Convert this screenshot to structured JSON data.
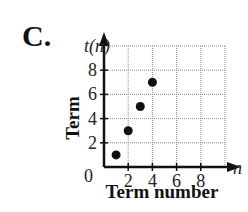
{
  "figure_label": "C.",
  "chart_data": {
    "type": "scatter",
    "title": "",
    "xlabel": "Term number",
    "ylabel": "Term",
    "x_axis_var": "n",
    "y_axis_var": "t(n)",
    "origin_label": "0",
    "x_ticks": [
      "2",
      "4",
      "6",
      "8"
    ],
    "y_ticks": [
      "2",
      "4",
      "6",
      "8"
    ],
    "xlim": [
      0,
      10
    ],
    "ylim": [
      0,
      10
    ],
    "grid": true,
    "points": [
      {
        "x": 1,
        "y": 1
      },
      {
        "x": 2,
        "y": 3
      },
      {
        "x": 3,
        "y": 5
      },
      {
        "x": 4,
        "y": 7
      }
    ]
  }
}
